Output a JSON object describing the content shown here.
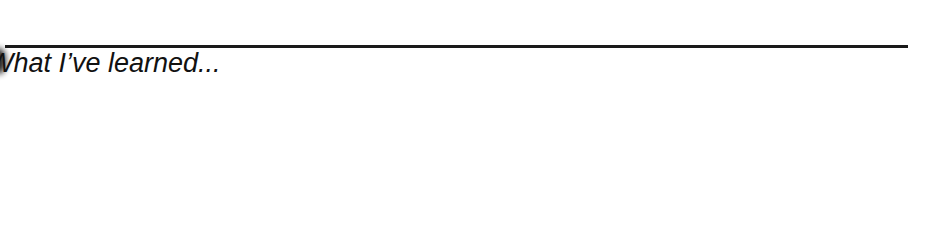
{
  "document": {
    "section_heading": "What I’ve learned...",
    "colors": {
      "rule": "#1a1a1a",
      "text": "#111111",
      "background": "#ffffff"
    }
  }
}
